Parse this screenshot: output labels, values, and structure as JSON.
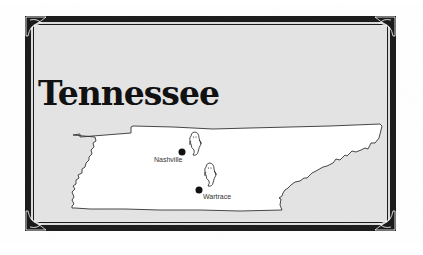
{
  "map": {
    "title": "Tennessee",
    "cities": [
      {
        "name": "Nashville",
        "marker": "ghost-icon"
      },
      {
        "name": "Wartrace",
        "marker": "ghost-icon"
      }
    ],
    "colors": {
      "background": "#e6e6e6",
      "border": "#1a1a1a",
      "state_fill": "#ffffff",
      "outline": "#333333",
      "dot": "#111111"
    }
  }
}
